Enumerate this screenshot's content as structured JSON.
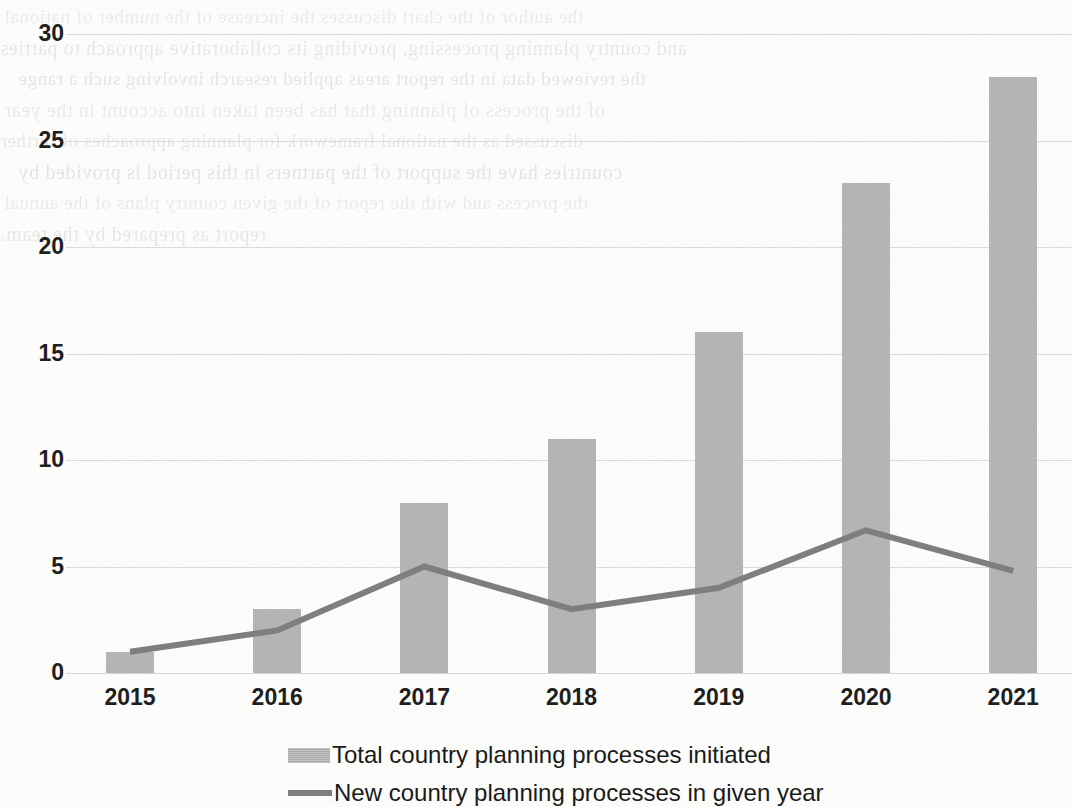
{
  "chart_data": {
    "type": "bar",
    "title": "",
    "subtitle": "",
    "xlabel": "",
    "ylabel": "",
    "categories": [
      "2015",
      "2016",
      "2017",
      "2018",
      "2019",
      "2020",
      "2021"
    ],
    "ylim": [
      0,
      30
    ],
    "yticks": [
      0,
      5,
      10,
      15,
      20,
      25,
      30
    ],
    "ytick_labels": [
      "0",
      "5",
      "10",
      "15",
      "20",
      "25",
      "30"
    ],
    "grid": true,
    "legend_position": "bottom",
    "series": [
      {
        "name": "Total country planning processes initiated",
        "type": "bar",
        "color": "#b4b4b4",
        "values": [
          1,
          3,
          8,
          11,
          16,
          23,
          28
        ]
      },
      {
        "name": "New country planning processes in given year",
        "type": "line",
        "color": "#7d7d7d",
        "values": [
          1,
          2,
          5,
          3,
          4,
          6.7,
          4.8
        ]
      }
    ],
    "legend": [
      {
        "label": "Total country planning processes initiated",
        "marker": "bar-swatch",
        "color": "#b4b4b4"
      },
      {
        "label": "New country planning processes in given year",
        "marker": "line-swatch",
        "color": "#7d7d7d"
      }
    ]
  },
  "background": {
    "kind": "scanned-page-bleed-through",
    "note": "faint mirrored show-through text from reverse side of the scanned page; not legible content",
    "lines": [
      "the author of the chart discusses the increase of the number of national",
      "and country planning processing, providing its collaborative approach to parties",
      "the reviewed data in the report areas applied research involving such a range",
      "of the process of planning that has been taken into account in the year",
      "discussed as the national framework for planning approaches of further",
      "countries have the support of the partners in this period is provided by",
      "the process and with the report of the given country plans of the annual",
      "report as prepared by the team."
    ]
  }
}
